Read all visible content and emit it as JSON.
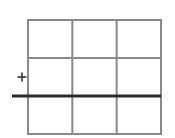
{
  "diagram": {
    "type": "grid-with-line",
    "grid": {
      "rows": 3,
      "cols": 3,
      "x": 28,
      "y": 20,
      "width": 133,
      "height": 114,
      "line_color": "#8a8a8a",
      "line_width": 2
    },
    "thick_line": {
      "x1": 12,
      "y1": 96,
      "x2": 161,
      "y2": 96,
      "color": "#2a2a2a",
      "width": 3
    },
    "marker": {
      "symbol": "plus",
      "cx": 22,
      "cy": 77,
      "size": 9,
      "color": "#333333",
      "width": 1.6
    }
  }
}
